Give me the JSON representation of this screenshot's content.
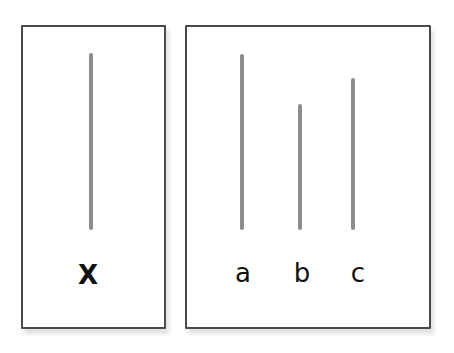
{
  "figure": {
    "reference_panel": {
      "label": "X",
      "line": {
        "x": 91,
        "top": 53,
        "bottom": 230
      }
    },
    "comparison_panel": {
      "items": [
        {
          "label": "a",
          "line": {
            "x": 242,
            "top": 54,
            "bottom": 230
          }
        },
        {
          "label": "b",
          "line": {
            "x": 300,
            "top": 104,
            "bottom": 230
          }
        },
        {
          "label": "c",
          "line": {
            "x": 353,
            "top": 78,
            "bottom": 230
          }
        }
      ]
    },
    "colors": {
      "border": "#4a4a4a",
      "line": "#8d8d8d",
      "text": "#111111"
    }
  }
}
